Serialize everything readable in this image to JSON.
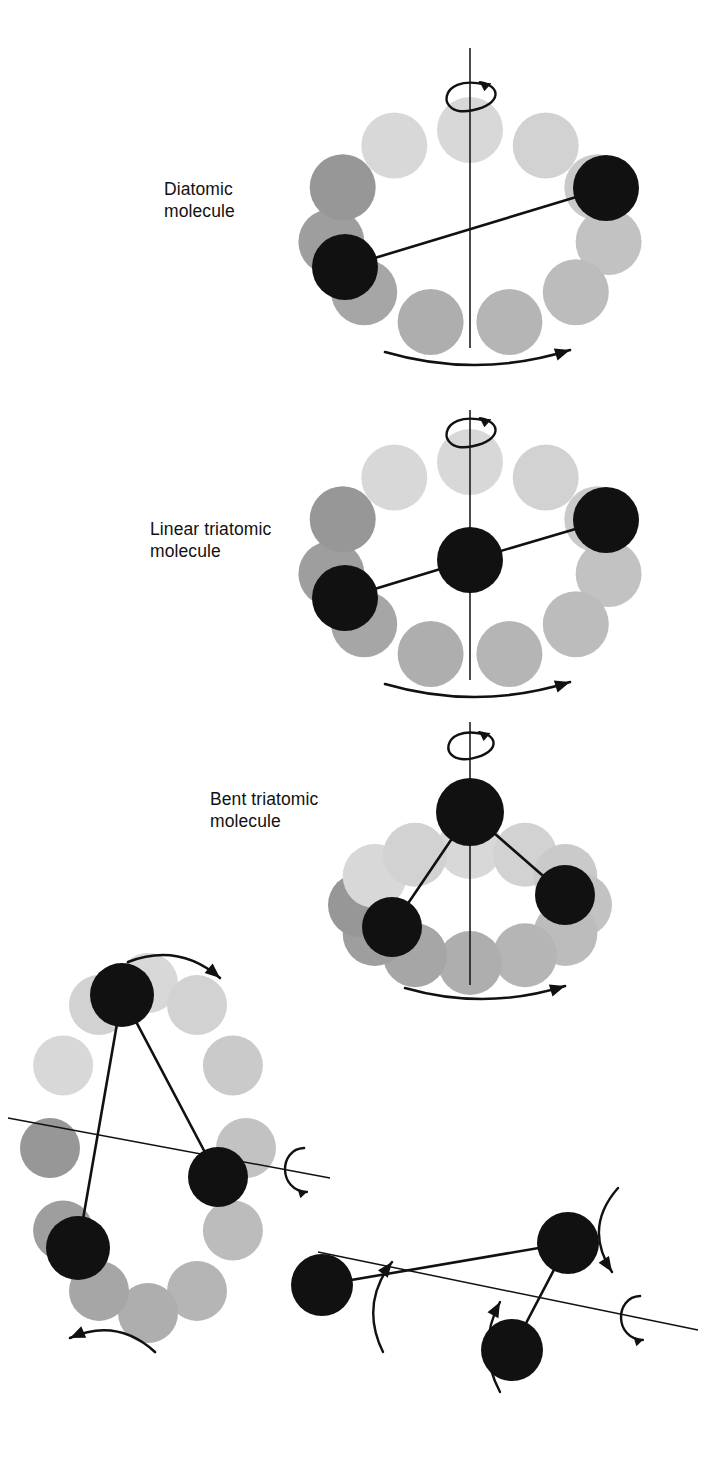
{
  "figure": {
    "background": "#ffffff",
    "width": 710,
    "height": 1465,
    "colors": {
      "atom_black": "#111111",
      "ghost_dark": "#9a9a9a",
      "ghost_mid": "#b5b5b5",
      "ghost_light": "#c9c9c9",
      "ghost_lightest": "#d8d8d8",
      "line": "#111111",
      "text": "#111111"
    }
  },
  "labels": [
    {
      "id": "diatomic",
      "text": "Diatomic\nmolecule",
      "x": 164,
      "y": 178
    },
    {
      "id": "linear-triatomic",
      "text": "Linear triatomic\nmolecule",
      "x": 150,
      "y": 518
    },
    {
      "id": "bent-triatomic",
      "text": "Bent triatomic\nmolecule",
      "x": 210,
      "y": 788
    }
  ],
  "panels": [
    {
      "id": "diatomic",
      "name": "Diatomic molecule rotating about a perpendicular axis",
      "label": "Diatomic\nmolecule",
      "axis": {
        "type": "vertical",
        "x": 470,
        "y1": 48,
        "y2": 348
      },
      "spin_loop": {
        "cx": 470,
        "cy": 96,
        "rx": 26,
        "ry": 15
      },
      "arc_arrow": {
        "x1": 385,
        "y1": 352,
        "x2": 570,
        "y2": 350,
        "sag": 14
      },
      "ring": {
        "cx": 470,
        "cy": 228,
        "rx": 140,
        "ry": 98,
        "count": 11,
        "r": 33
      },
      "atoms": [
        {
          "id": "a1",
          "cx": 606,
          "cy": 188,
          "r": 33,
          "fill": "#111111"
        },
        {
          "id": "a2",
          "cx": 345,
          "cy": 267,
          "r": 33,
          "fill": "#111111"
        }
      ],
      "bonds": [
        {
          "from": "a1",
          "to": "a2"
        }
      ]
    },
    {
      "id": "linear-triatomic",
      "name": "Linear triatomic molecule rotating about a perpendicular axis",
      "label": "Linear triatomic\nmolecule",
      "axis": {
        "type": "vertical",
        "x": 470,
        "y1": 410,
        "y2": 680
      },
      "spin_loop": {
        "cx": 470,
        "cy": 432,
        "rx": 26,
        "ry": 15
      },
      "arc_arrow": {
        "x1": 385,
        "y1": 684,
        "x2": 570,
        "y2": 682,
        "sag": 14
      },
      "ring": {
        "cx": 470,
        "cy": 560,
        "rx": 140,
        "ry": 98,
        "count": 11,
        "r": 33
      },
      "atoms": [
        {
          "id": "b1",
          "cx": 606,
          "cy": 520,
          "r": 33,
          "fill": "#111111"
        },
        {
          "id": "b2",
          "cx": 470,
          "cy": 560,
          "r": 33,
          "fill": "#111111"
        },
        {
          "id": "b3",
          "cx": 345,
          "cy": 598,
          "r": 33,
          "fill": "#111111"
        }
      ],
      "bonds": [
        {
          "from": "b1",
          "to": "b2"
        },
        {
          "from": "b2",
          "to": "b3"
        }
      ]
    },
    {
      "id": "bent-triatomic",
      "name": "Bent triatomic molecule rotating about its symmetry axis",
      "label": "Bent triatomic\nmolecule",
      "axis": {
        "type": "vertical",
        "x": 470,
        "y1": 722,
        "y2": 985
      },
      "spin_loop": {
        "cx": 470,
        "cy": 745,
        "rx": 24,
        "ry": 14
      },
      "arc_arrow": {
        "x1": 405,
        "y1": 988,
        "x2": 565,
        "y2": 986,
        "sag": 12
      },
      "ring": {
        "cx": 470,
        "cy": 905,
        "rx": 110,
        "ry": 58,
        "count": 12,
        "r": 32
      },
      "atoms": [
        {
          "id": "c1",
          "cx": 470,
          "cy": 812,
          "r": 34,
          "fill": "#111111"
        },
        {
          "id": "c2",
          "cx": 565,
          "cy": 895,
          "r": 30,
          "fill": "#111111"
        },
        {
          "id": "c3",
          "cx": 392,
          "cy": 927,
          "r": 30,
          "fill": "#111111"
        }
      ],
      "bonds": [
        {
          "from": "c1",
          "to": "c2"
        },
        {
          "from": "c1",
          "to": "c3"
        }
      ]
    },
    {
      "id": "bent-inplane-a",
      "name": "Bent triatomic molecule rotating about an in-plane axis",
      "axis": {
        "type": "tilted",
        "x1": 8,
        "y1": 1118,
        "x2": 330,
        "y2": 1178
      },
      "spin_loop": {
        "cx": 302,
        "cy": 1170,
        "rx": 14,
        "ry": 22,
        "style": "side"
      },
      "top_arrow": {
        "x1": 128,
        "y1": 962,
        "x2": 220,
        "y2": 978,
        "sag": -14
      },
      "bottom_arrow": {
        "x1": 155,
        "y1": 1352,
        "x2": 70,
        "y2": 1338,
        "sag": 14
      },
      "ring": {
        "cx": 148,
        "cy": 1148,
        "rx": 98,
        "ry": 165,
        "count": 12,
        "r": 30
      },
      "atoms": [
        {
          "id": "d1",
          "cx": 122,
          "cy": 995,
          "r": 32,
          "fill": "#111111"
        },
        {
          "id": "d2",
          "cx": 218,
          "cy": 1177,
          "r": 30,
          "fill": "#111111"
        },
        {
          "id": "d3",
          "cx": 78,
          "cy": 1248,
          "r": 32,
          "fill": "#111111"
        }
      ],
      "bonds": [
        {
          "from": "d1",
          "to": "d2"
        },
        {
          "from": "d1",
          "to": "d3"
        }
      ]
    },
    {
      "id": "bent-inplane-b",
      "name": "Bent triatomic molecule rotating about the remaining in-plane axis",
      "axis": {
        "type": "tilted",
        "x1": 318,
        "y1": 1252,
        "x2": 698,
        "y2": 1330
      },
      "spin_loop": {
        "cx": 638,
        "cy": 1318,
        "rx": 14,
        "ry": 22,
        "style": "side"
      },
      "arrow_right": {
        "x1": 618,
        "y1": 1188,
        "x2": 612,
        "y2": 1272,
        "bow": 16
      },
      "arrow_left": {
        "x1": 383,
        "y1": 1352,
        "x2": 392,
        "y2": 1262,
        "bow": -14
      },
      "arrow_mid": {
        "x1": 500,
        "y1": 1392,
        "x2": 500,
        "y2": 1302,
        "bow": -12
      },
      "atoms": [
        {
          "id": "e1",
          "cx": 568,
          "cy": 1243,
          "r": 31,
          "fill": "#111111"
        },
        {
          "id": "e2",
          "cx": 322,
          "cy": 1285,
          "r": 31,
          "fill": "#111111"
        },
        {
          "id": "e3",
          "cx": 512,
          "cy": 1350,
          "r": 31,
          "fill": "#111111"
        }
      ],
      "bonds": [
        {
          "from": "e1",
          "to": "e2"
        },
        {
          "from": "e1",
          "to": "e3"
        }
      ]
    }
  ],
  "ghost_ramp": [
    "#d8d8d8",
    "#d2d2d2",
    "#cacaca",
    "#c2c2c2",
    "#bcbcbc",
    "#b5b5b5",
    "#aeaeae",
    "#a6a6a6",
    "#9e9e9e",
    "#979797"
  ]
}
